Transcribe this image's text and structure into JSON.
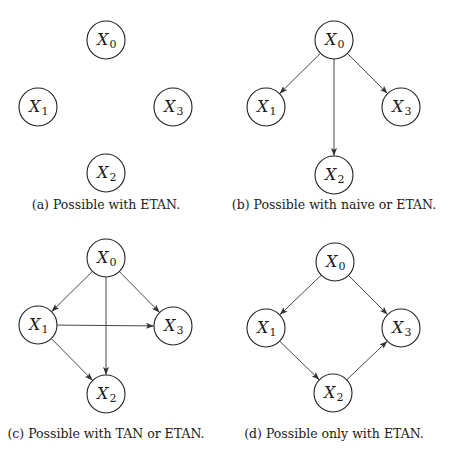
{
  "figure": {
    "panels": [
      {
        "id": "a",
        "caption": "(a) Possible with ETAN.",
        "caption_pos": [
          106,
          209
        ],
        "nodes": [
          {
            "id": "X0",
            "var": "X",
            "sub": "0",
            "x": 106,
            "y": 40
          },
          {
            "id": "X1",
            "var": "X",
            "sub": "1",
            "x": 38,
            "y": 107
          },
          {
            "id": "X3",
            "var": "X",
            "sub": "3",
            "x": 173,
            "y": 107
          },
          {
            "id": "X2",
            "var": "X",
            "sub": "2",
            "x": 106,
            "y": 173
          }
        ],
        "edges": []
      },
      {
        "id": "b",
        "caption": "(b) Possible with naive or ETAN.",
        "caption_pos": [
          334,
          209
        ],
        "nodes": [
          {
            "id": "X0",
            "var": "X",
            "sub": "0",
            "x": 334,
            "y": 40
          },
          {
            "id": "X1",
            "var": "X",
            "sub": "1",
            "x": 266,
            "y": 107
          },
          {
            "id": "X3",
            "var": "X",
            "sub": "3",
            "x": 401,
            "y": 107
          },
          {
            "id": "X2",
            "var": "X",
            "sub": "2",
            "x": 334,
            "y": 175
          }
        ],
        "edges": [
          {
            "from": "X0",
            "to": "X1"
          },
          {
            "from": "X0",
            "to": "X3"
          },
          {
            "from": "X0",
            "to": "X2"
          }
        ]
      },
      {
        "id": "c",
        "caption": "(c) Possible with TAN or ETAN.",
        "caption_pos": [
          106,
          438
        ],
        "nodes": [
          {
            "id": "X0",
            "var": "X",
            "sub": "0",
            "x": 106,
            "y": 258
          },
          {
            "id": "X1",
            "var": "X",
            "sub": "1",
            "x": 38,
            "y": 325
          },
          {
            "id": "X3",
            "var": "X",
            "sub": "3",
            "x": 173,
            "y": 326
          },
          {
            "id": "X2",
            "var": "X",
            "sub": "2",
            "x": 106,
            "y": 394
          }
        ],
        "edges": [
          {
            "from": "X0",
            "to": "X1"
          },
          {
            "from": "X0",
            "to": "X3"
          },
          {
            "from": "X0",
            "to": "X2"
          },
          {
            "from": "X1",
            "to": "X3"
          },
          {
            "from": "X1",
            "to": "X2"
          }
        ]
      },
      {
        "id": "d",
        "caption": "(d) Possible only with ETAN.",
        "caption_pos": [
          334,
          438
        ],
        "nodes": [
          {
            "id": "X0",
            "var": "X",
            "sub": "0",
            "x": 335,
            "y": 262
          },
          {
            "id": "X1",
            "var": "X",
            "sub": "1",
            "x": 266,
            "y": 328
          },
          {
            "id": "X3",
            "var": "X",
            "sub": "3",
            "x": 401,
            "y": 328
          },
          {
            "id": "X2",
            "var": "X",
            "sub": "2",
            "x": 333,
            "y": 393
          }
        ],
        "edges": [
          {
            "from": "X0",
            "to": "X1"
          },
          {
            "from": "X0",
            "to": "X3"
          },
          {
            "from": "X1",
            "to": "X2"
          },
          {
            "from": "X2",
            "to": "X3"
          }
        ]
      }
    ],
    "style": {
      "node_radius": 19,
      "stroke_color": "#222222",
      "background": "#ffffff"
    }
  }
}
